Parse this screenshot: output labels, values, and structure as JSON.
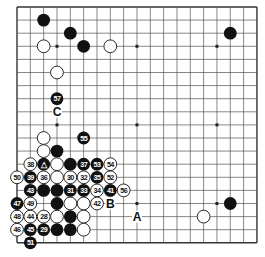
{
  "board": {
    "size": 19,
    "origin_x": 17,
    "origin_y": 7,
    "spacing_x": 13.33,
    "spacing_y": 13.1,
    "stone_radius": 6.4,
    "line_color": "#555555",
    "edge_color": "#333333",
    "black_color": "#111111",
    "white_color": "#ffffff",
    "star_points": [
      [
        3,
        3
      ],
      [
        3,
        9
      ],
      [
        3,
        15
      ],
      [
        9,
        3
      ],
      [
        9,
        9
      ],
      [
        9,
        15
      ],
      [
        15,
        3
      ],
      [
        15,
        9
      ],
      [
        15,
        15
      ]
    ]
  },
  "stones": [
    {
      "col": 2,
      "row": 1,
      "color": "black",
      "label": ""
    },
    {
      "col": 4,
      "row": 2,
      "color": "black",
      "label": ""
    },
    {
      "col": 5,
      "row": 3,
      "color": "black",
      "label": ""
    },
    {
      "col": 2,
      "row": 3,
      "color": "white",
      "label": ""
    },
    {
      "col": 7,
      "row": 3,
      "color": "white",
      "label": ""
    },
    {
      "col": 3,
      "row": 5,
      "color": "white",
      "label": ""
    },
    {
      "col": 3,
      "row": 7,
      "color": "black",
      "label": "57"
    },
    {
      "col": 16,
      "row": 2,
      "color": "black",
      "label": ""
    },
    {
      "col": 16,
      "row": 15,
      "color": "black",
      "label": ""
    },
    {
      "col": 14,
      "row": 16,
      "color": "white",
      "label": ""
    },
    {
      "col": 2,
      "row": 10,
      "color": "white",
      "label": ""
    },
    {
      "col": 5,
      "row": 10,
      "color": "black",
      "label": "55"
    },
    {
      "col": 2,
      "row": 11,
      "color": "white",
      "label": ""
    },
    {
      "col": 3,
      "row": 11,
      "color": "black",
      "label": ""
    },
    {
      "col": 1,
      "row": 12,
      "color": "white",
      "label": "38"
    },
    {
      "col": 2,
      "row": 12,
      "color": "black",
      "label": "△"
    },
    {
      "col": 3,
      "row": 12,
      "color": "white",
      "label": ""
    },
    {
      "col": 4,
      "row": 12,
      "color": "black",
      "label": ""
    },
    {
      "col": 5,
      "row": 12,
      "color": "black",
      "label": "37"
    },
    {
      "col": 6,
      "row": 12,
      "color": "black",
      "label": "53"
    },
    {
      "col": 7,
      "row": 12,
      "color": "white",
      "label": "54"
    },
    {
      "col": 0,
      "row": 13,
      "color": "white",
      "label": "50"
    },
    {
      "col": 1,
      "row": 13,
      "color": "black",
      "label": "39"
    },
    {
      "col": 2,
      "row": 13,
      "color": "white",
      "label": "36"
    },
    {
      "col": 3,
      "row": 13,
      "color": "white",
      "label": ""
    },
    {
      "col": 4,
      "row": 13,
      "color": "white",
      "label": "30"
    },
    {
      "col": 5,
      "row": 13,
      "color": "white",
      "label": "32"
    },
    {
      "col": 6,
      "row": 13,
      "color": "black",
      "label": "35"
    },
    {
      "col": 7,
      "row": 13,
      "color": "white",
      "label": "52"
    },
    {
      "col": 1,
      "row": 14,
      "color": "black",
      "label": "43"
    },
    {
      "col": 2,
      "row": 14,
      "color": "black",
      "label": ""
    },
    {
      "col": 3,
      "row": 14,
      "color": "black",
      "label": ""
    },
    {
      "col": 4,
      "row": 14,
      "color": "black",
      "label": "31"
    },
    {
      "col": 5,
      "row": 14,
      "color": "black",
      "label": "33"
    },
    {
      "col": 6,
      "row": 14,
      "color": "white",
      "label": "34"
    },
    {
      "col": 7,
      "row": 14,
      "color": "black",
      "label": "41"
    },
    {
      "col": 8,
      "row": 14,
      "color": "white",
      "label": "56"
    },
    {
      "col": 0,
      "row": 15,
      "color": "black",
      "label": "47"
    },
    {
      "col": 1,
      "row": 15,
      "color": "white",
      "label": "49"
    },
    {
      "col": 3,
      "row": 15,
      "color": "black",
      "label": ""
    },
    {
      "col": 4,
      "row": 15,
      "color": "white",
      "label": ""
    },
    {
      "col": 5,
      "row": 15,
      "color": "white",
      "label": ""
    },
    {
      "col": 6,
      "row": 15,
      "color": "white",
      "label": "42"
    },
    {
      "col": 0,
      "row": 16,
      "color": "white",
      "label": "48"
    },
    {
      "col": 1,
      "row": 16,
      "color": "white",
      "label": "44"
    },
    {
      "col": 2,
      "row": 16,
      "color": "white",
      "label": "28"
    },
    {
      "col": 3,
      "row": 16,
      "color": "white",
      "label": ""
    },
    {
      "col": 4,
      "row": 16,
      "color": "black",
      "label": ""
    },
    {
      "col": 5,
      "row": 16,
      "color": "white",
      "label": ""
    },
    {
      "col": 0,
      "row": 17,
      "color": "white",
      "label": "46"
    },
    {
      "col": 1,
      "row": 17,
      "color": "black",
      "label": "45"
    },
    {
      "col": 2,
      "row": 17,
      "color": "black",
      "label": "29"
    },
    {
      "col": 3,
      "row": 17,
      "color": "black",
      "label": ""
    },
    {
      "col": 4,
      "row": 17,
      "color": "black",
      "label": ""
    },
    {
      "col": 5,
      "row": 17,
      "color": "white",
      "label": ""
    },
    {
      "col": 1,
      "row": 18,
      "color": "black",
      "label": "51"
    }
  ],
  "markers": [
    {
      "col": 3,
      "row": 8,
      "label": "C"
    },
    {
      "col": 7,
      "row": 15,
      "label": "B"
    },
    {
      "col": 9,
      "row": 16,
      "label": "A"
    }
  ]
}
